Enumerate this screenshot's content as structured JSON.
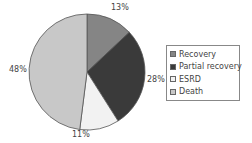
{
  "chart_data": {
    "type": "pie",
    "title": "",
    "categories": [
      "Recovery",
      "Partial recovery",
      "ESRD",
      "Death"
    ],
    "values": [
      13,
      28,
      11,
      48
    ],
    "labels": [
      "13%",
      "28%",
      "11%",
      "48%"
    ],
    "colors": [
      "#858585",
      "#3a3a3a",
      "#f2f2f2",
      "#c8c8c8"
    ],
    "start_angle_deg": 0,
    "direction": "clockwise",
    "legend_position": "right"
  },
  "legend": {
    "items": [
      {
        "label": "Recovery",
        "color": "#858585"
      },
      {
        "label": "Partial recovery",
        "color": "#3a3a3a"
      },
      {
        "label": "ESRD",
        "color": "#f2f2f2"
      },
      {
        "label": "Death",
        "color": "#c8c8c8"
      }
    ]
  }
}
